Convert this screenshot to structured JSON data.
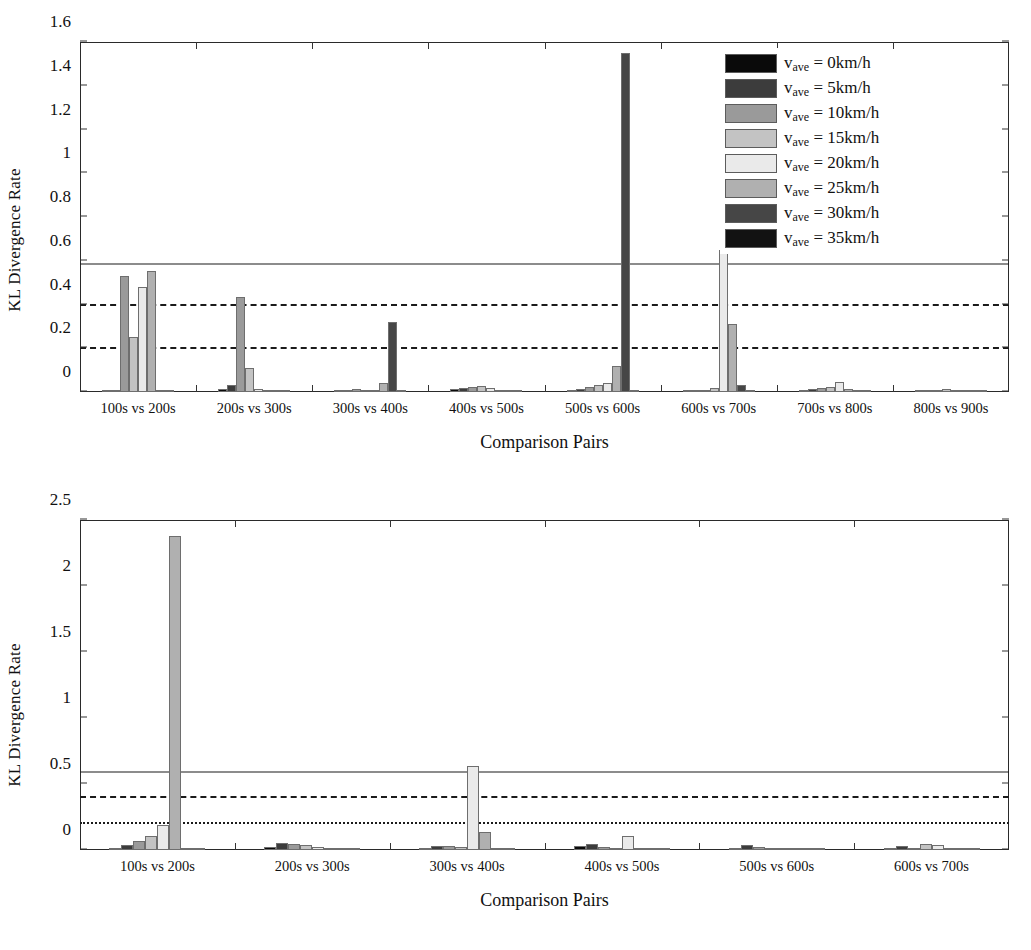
{
  "series_colors": [
    "#0a0a0a",
    "#3c3c3c",
    "#9a9a9a",
    "#c3c3c3",
    "#eaeaea",
    "#b0b0b0",
    "#464646",
    "#121212"
  ],
  "legend": {
    "var_symbol": "v",
    "var_sub": "ave",
    "items": [
      {
        "label": "v_ave = 0km/h",
        "value": "0km/h"
      },
      {
        "label": "v_ave = 5km/h",
        "value": "5km/h"
      },
      {
        "label": "v_ave = 10km/h",
        "value": "10km/h"
      },
      {
        "label": "v_ave = 15km/h",
        "value": "15km/h"
      },
      {
        "label": "v_ave = 20km/h",
        "value": "20km/h"
      },
      {
        "label": "v_ave = 25km/h",
        "value": "25km/h"
      },
      {
        "label": "v_ave = 30km/h",
        "value": "30km/h"
      },
      {
        "label": "v_ave = 35km/h",
        "value": "35km/h"
      }
    ]
  },
  "chart_data": [
    {
      "id": "top",
      "type": "bar",
      "title": "",
      "xlabel": "Comparison Pairs",
      "ylabel": "KL Divergence Rate",
      "ylim": [
        0,
        1.6
      ],
      "yticks": [
        "0",
        "0.2",
        "0.4",
        "0.6",
        "0.8",
        "1",
        "1.2",
        "1.4",
        "1.6"
      ],
      "ytick_values": [
        0,
        0.2,
        0.4,
        0.6,
        0.8,
        1.0,
        1.2,
        1.4,
        1.6
      ],
      "grid": false,
      "legend_position": "top-right",
      "categories": [
        "100s vs 200s",
        "200s vs 300s",
        "300s vs 400s",
        "400s vs 500s",
        "500s vs 600s",
        "600s vs 700s",
        "700s vs 800s",
        "800s vs 900s"
      ],
      "reference_lines": [
        {
          "value": 0.58,
          "style": "solid"
        },
        {
          "value": 0.39,
          "style": "dashdot"
        },
        {
          "value": 0.19,
          "style": "dashed"
        }
      ],
      "series": [
        {
          "name": "v_ave = 0km/h",
          "values": [
            0.008,
            0.012,
            0.004,
            0.012,
            0.006,
            0.004,
            0.01,
            0.004
          ]
        },
        {
          "name": "v_ave = 5km/h",
          "values": [
            0.006,
            0.03,
            0.01,
            0.02,
            0.014,
            0.006,
            0.016,
            0.006
          ]
        },
        {
          "name": "v_ave = 10km/h",
          "values": [
            0.53,
            0.435,
            0.012,
            0.022,
            0.022,
            0.01,
            0.018,
            0.008
          ]
        },
        {
          "name": "v_ave = 15km/h",
          "values": [
            0.25,
            0.11,
            0.006,
            0.026,
            0.032,
            0.018,
            0.022,
            0.016
          ]
        },
        {
          "name": "v_ave = 20km/h",
          "values": [
            0.48,
            0.012,
            0.008,
            0.018,
            0.042,
            0.65,
            0.046,
            0.01
          ]
        },
        {
          "name": "v_ave = 25km/h",
          "values": [
            0.552,
            0.006,
            0.04,
            0.008,
            0.12,
            0.31,
            0.012,
            0.006
          ]
        },
        {
          "name": "v_ave = 30km/h",
          "values": [
            0.004,
            0.004,
            0.318,
            0.006,
            1.55,
            0.03,
            0.006,
            0.004
          ]
        },
        {
          "name": "v_ave = 35km/h",
          "values": [
            0.01,
            0.006,
            0.01,
            0.004,
            0.006,
            0.004,
            0.004,
            0.004
          ]
        }
      ]
    },
    {
      "id": "bottom",
      "type": "bar",
      "title": "",
      "xlabel": "Comparison Pairs",
      "ylabel": "KL Divergence Rate",
      "ylim": [
        0,
        2.5
      ],
      "yticks": [
        "0",
        "0.5",
        "1",
        "1.5",
        "2",
        "2.5"
      ],
      "ytick_values": [
        0,
        0.5,
        1.0,
        1.5,
        2.0,
        2.5
      ],
      "grid": false,
      "legend_position": "top-right",
      "categories": [
        "100s vs 200s",
        "200s vs 300s",
        "300s vs 400s",
        "400s vs 500s",
        "500s vs 600s",
        "600s vs 700s"
      ],
      "reference_lines": [
        {
          "value": 0.58,
          "style": "solid"
        },
        {
          "value": 0.39,
          "style": "dashdot"
        },
        {
          "value": 0.19,
          "style": "dotted"
        }
      ],
      "series": [
        {
          "name": "v_ave = 0km/h",
          "values": [
            0.008,
            0.02,
            0.01,
            0.03,
            0.012,
            0.018
          ]
        },
        {
          "name": "v_ave = 5km/h",
          "values": [
            0.04,
            0.055,
            0.03,
            0.048,
            0.035,
            0.03
          ]
        },
        {
          "name": "v_ave = 10km/h",
          "values": [
            0.07,
            0.048,
            0.028,
            0.02,
            0.022,
            0.014
          ]
        },
        {
          "name": "v_ave = 15km/h",
          "values": [
            0.105,
            0.04,
            0.022,
            0.012,
            0.016,
            0.044
          ]
        },
        {
          "name": "v_ave = 20km/h",
          "values": [
            0.19,
            0.022,
            0.64,
            0.105,
            0.01,
            0.04
          ]
        },
        {
          "name": "v_ave = 25km/h",
          "values": [
            2.38,
            0.016,
            0.14,
            0.008,
            0.006,
            0.012
          ]
        },
        {
          "name": "v_ave = 30km/h",
          "values": [
            0.006,
            0.008,
            0.006,
            0.006,
            0.004,
            0.006
          ]
        },
        {
          "name": "v_ave = 35km/h",
          "values": [
            0.004,
            0.004,
            0.004,
            0.004,
            0.004,
            0.004
          ]
        }
      ]
    }
  ]
}
